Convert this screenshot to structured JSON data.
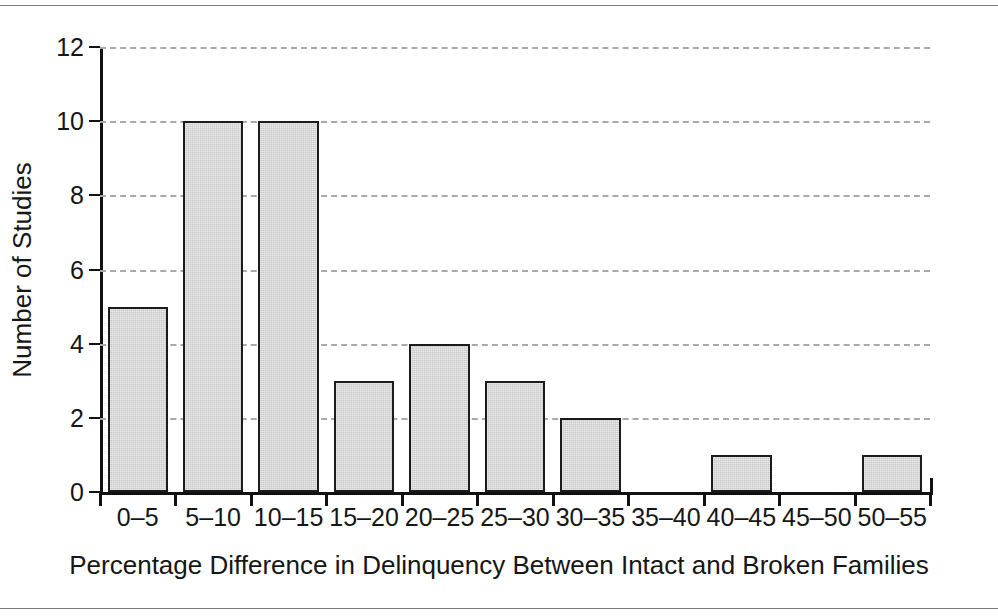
{
  "chart_data": {
    "type": "bar",
    "title": "",
    "subtitle": "",
    "xlabel": "Percentage Difference in Delinquency Between Intact and Broken Families",
    "ylabel": "Number of Studies",
    "categories": [
      "0–5",
      "5–10",
      "10–15",
      "15–20",
      "20–25",
      "25–30",
      "30–35",
      "35–40",
      "40–45",
      "45–50",
      "50–55"
    ],
    "values": [
      5,
      10,
      10,
      3,
      4,
      3,
      2,
      0,
      1,
      0,
      1
    ],
    "ylim": [
      0,
      12
    ],
    "yticks": [
      0,
      2,
      4,
      6,
      8,
      10,
      12
    ],
    "ytick_labels": [
      "0",
      "2",
      "4",
      "6",
      "8",
      "10",
      "12"
    ],
    "grid": true,
    "grid_axis": "y",
    "grid_style": "dashed",
    "legend": false,
    "legend_position": "none",
    "bar_fill_color": "#c9c9c9",
    "bar_edge_color": "#1b1b1b",
    "grid_color": "#a9a9a9",
    "axis_color": "#111111",
    "background_color": "#ffffff"
  },
  "figure": {
    "frame_rule_color": "#7a7a7a",
    "has_top_rule": true,
    "has_bottom_rule": true
  }
}
